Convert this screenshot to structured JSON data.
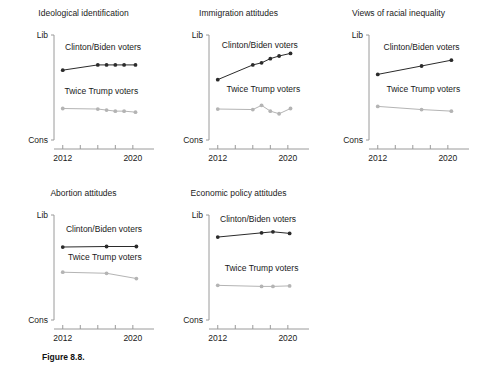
{
  "figure": {
    "caption": "Figure 8.8.",
    "caption_x": 42,
    "caption_y": 352
  },
  "style": {
    "dem_color": "#2b2b2b",
    "rep_color": "#b4b4b4",
    "axis_color": "#9a9a9a",
    "text_color": "#1a1a1a"
  },
  "axis": {
    "y_top_label": "Lib",
    "y_bottom_label": "Cons",
    "x_first_label": "2012",
    "x_last_label": "2020"
  },
  "series_names": {
    "dem": "Clinton/Biden voters",
    "rep": "Twice Trump voters"
  },
  "chart_data": [
    {
      "id": "ideological-identification",
      "type": "line",
      "title": "Ideological identification",
      "xlabel": "",
      "ylabel": "",
      "ylim": [
        0,
        1
      ],
      "ytick_labels": [
        "Cons",
        "Lib"
      ],
      "xlim": [
        2011,
        2021.5
      ],
      "xtick_values": [
        2012,
        2014,
        2016,
        2018,
        2020
      ],
      "xtick_labels": [
        "2012",
        "",
        "",
        "",
        "2020"
      ],
      "grid": false,
      "legend": "inline-annotation",
      "series": [
        {
          "name": "Clinton/Biden voters",
          "color": "#2b2b2b",
          "x": [
            2012,
            2016,
            2017,
            2018,
            2019,
            2020.3
          ],
          "values": [
            0.665,
            0.715,
            0.715,
            0.715,
            0.715,
            0.715
          ]
        },
        {
          "name": "Twice Trump voters",
          "color": "#b4b4b4",
          "x": [
            2012,
            2016,
            2017,
            2018,
            2019,
            2020.3
          ],
          "values": [
            0.3,
            0.295,
            0.285,
            0.275,
            0.275,
            0.265
          ]
        }
      ],
      "annotations": [
        {
          "text": "Clinton/Biden voters",
          "x": 2016.6,
          "y": 0.855
        },
        {
          "text": "Twice Trump voters",
          "x": 2016.4,
          "y": 0.44
        }
      ]
    },
    {
      "id": "immigration-attitudes",
      "type": "line",
      "title": "Immigration attitudes",
      "xlabel": "",
      "ylabel": "",
      "ylim": [
        0,
        1
      ],
      "ytick_labels": [
        "Cons",
        "Lib"
      ],
      "xlim": [
        2011,
        2021.5
      ],
      "xtick_values": [
        2012,
        2014,
        2016,
        2018,
        2020
      ],
      "xtick_labels": [
        "2012",
        "",
        "",
        "",
        "2020"
      ],
      "grid": false,
      "legend": "inline-annotation",
      "series": [
        {
          "name": "Clinton/Biden voters",
          "color": "#2b2b2b",
          "x": [
            2012,
            2016,
            2017,
            2018,
            2019,
            2020.3
          ],
          "values": [
            0.575,
            0.715,
            0.735,
            0.775,
            0.8,
            0.825
          ]
        },
        {
          "name": "Twice Trump voters",
          "color": "#b4b4b4",
          "x": [
            2012,
            2016,
            2017,
            2018,
            2019,
            2020.3
          ],
          "values": [
            0.295,
            0.29,
            0.33,
            0.275,
            0.25,
            0.3
          ]
        }
      ],
      "annotations": [
        {
          "text": "Clinton/Biden voters",
          "x": 2016.8,
          "y": 0.88
        },
        {
          "text": "Twice Trump voters",
          "x": 2017.2,
          "y": 0.455
        }
      ]
    },
    {
      "id": "views-of-racial-inequality",
      "type": "line",
      "title": "Views of racial inequality",
      "xlabel": "",
      "ylabel": "",
      "ylim": [
        0,
        1
      ],
      "ytick_labels": [
        "Cons",
        "Lib"
      ],
      "xlim": [
        2011,
        2021.5
      ],
      "xtick_values": [
        2012,
        2014,
        2016,
        2018,
        2020
      ],
      "xtick_labels": [
        "2012",
        "",
        "",
        "",
        "2020"
      ],
      "grid": false,
      "legend": "inline-annotation",
      "series": [
        {
          "name": "Clinton/Biden voters",
          "color": "#2b2b2b",
          "x": [
            2012,
            2017,
            2020.4
          ],
          "values": [
            0.625,
            0.705,
            0.76
          ]
        },
        {
          "name": "Twice Trump voters",
          "color": "#b4b4b4",
          "x": [
            2012,
            2017,
            2020.4
          ],
          "values": [
            0.32,
            0.29,
            0.275
          ]
        }
      ],
      "annotations": [
        {
          "text": "Clinton/Biden voters",
          "x": 2017.0,
          "y": 0.855
        },
        {
          "text": "Twice Trump voters",
          "x": 2017.2,
          "y": 0.455
        }
      ]
    },
    {
      "id": "abortion-attitudes",
      "type": "line",
      "title": "Abortion attitudes",
      "xlabel": "",
      "ylabel": "",
      "ylim": [
        0,
        1
      ],
      "ytick_labels": [
        "Cons",
        "Lib"
      ],
      "xlim": [
        2011,
        2021.5
      ],
      "xtick_values": [
        2012,
        2014,
        2016,
        2018,
        2020
      ],
      "xtick_labels": [
        "2012",
        "",
        "",
        "",
        "2020"
      ],
      "grid": false,
      "legend": "inline-annotation",
      "series": [
        {
          "name": "Clinton/Biden voters",
          "color": "#2b2b2b",
          "x": [
            2012,
            2017,
            2020.4
          ],
          "values": [
            0.695,
            0.7,
            0.7
          ]
        },
        {
          "name": "Twice Trump voters",
          "color": "#b4b4b4",
          "x": [
            2012,
            2017,
            2020.4
          ],
          "values": [
            0.455,
            0.445,
            0.395
          ]
        }
      ],
      "annotations": [
        {
          "text": "Clinton/Biden voters",
          "x": 2016.7,
          "y": 0.835
        },
        {
          "text": "Twice Trump voters",
          "x": 2016.8,
          "y": 0.575
        }
      ]
    },
    {
      "id": "economic-policy-attitudes",
      "type": "line",
      "title": "Economic policy attitudes",
      "xlabel": "",
      "ylabel": "",
      "ylim": [
        0,
        1
      ],
      "ytick_labels": [
        "Cons",
        "Lib"
      ],
      "xlim": [
        2011,
        2021.5
      ],
      "xtick_values": [
        2012,
        2014,
        2016,
        2018,
        2020
      ],
      "xtick_labels": [
        "2012",
        "",
        "",
        "",
        "2020"
      ],
      "grid": false,
      "legend": "inline-annotation",
      "series": [
        {
          "name": "Clinton/Biden voters",
          "color": "#2b2b2b",
          "x": [
            2012,
            2017,
            2018.3,
            2020.2
          ],
          "values": [
            0.79,
            0.83,
            0.84,
            0.825
          ]
        },
        {
          "name": "Twice Trump voters",
          "color": "#b4b4b4",
          "x": [
            2012,
            2017,
            2018.3,
            2020.2
          ],
          "values": [
            0.33,
            0.32,
            0.32,
            0.325
          ]
        }
      ],
      "annotations": [
        {
          "text": "Clinton/Biden voters",
          "x": 2016.6,
          "y": 0.935
        },
        {
          "text": "Twice Trump voters",
          "x": 2017.0,
          "y": 0.47
        }
      ]
    }
  ]
}
